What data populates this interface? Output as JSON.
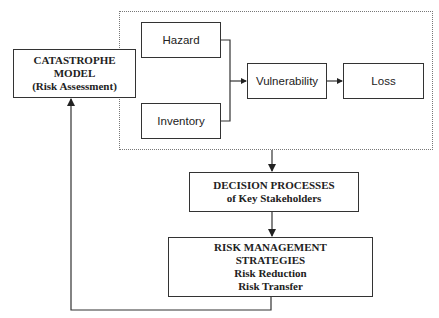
{
  "diagram": {
    "catastrophe_model": {
      "line1": "CATASTROPHE",
      "line2": "MODEL",
      "line3": "(Risk Assessment)"
    },
    "components": {
      "hazard": "Hazard",
      "inventory": "Inventory",
      "vulnerability": "Vulnerability",
      "loss": "Loss"
    },
    "decision": {
      "line1": "DECISION PROCESSES",
      "line2": "of Key Stakeholders"
    },
    "risk_management": {
      "line1": "RISK MANAGEMENT",
      "line2": "STRATEGIES",
      "line3": "Risk Reduction",
      "line4": "Risk Transfer"
    },
    "colors": {
      "line": "#333333",
      "dotted_border": "#777777",
      "background": "#ffffff"
    }
  }
}
